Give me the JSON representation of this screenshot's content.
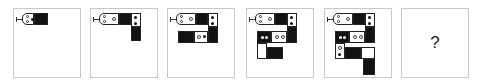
{
  "puzzle": {
    "description": "Sequence of snake-like block figures; predict the next figure",
    "panels": [
      {
        "index": 1,
        "content": "figure",
        "segments": [
          "head",
          "ring-dot cell",
          "black"
        ]
      },
      {
        "index": 2,
        "content": "figure",
        "segments": [
          "head",
          "ring cell",
          "black",
          "two-dot cell",
          "black"
        ]
      },
      {
        "index": 3,
        "content": "figure",
        "segments": [
          "head",
          "ring cell",
          "black",
          "two-dot cell",
          "black",
          "ring-dot cell",
          "black"
        ]
      },
      {
        "index": 4,
        "content": "figure",
        "segments": [
          "head",
          "ring cell",
          "black",
          "two-dot cell",
          "black",
          "two-ring cell",
          "black two-dot cell",
          "white",
          "black"
        ]
      },
      {
        "index": 5,
        "content": "figure",
        "segments": [
          "head",
          "ring cell",
          "black",
          "two-dot cell",
          "black",
          "two-ring cell",
          "black two-dot cell",
          "ring-dot cell",
          "black",
          "white",
          "black"
        ]
      },
      {
        "index": 6,
        "content": "question",
        "label": "?"
      }
    ]
  },
  "colors": {
    "border": "#c8c8c8",
    "fill": "#111111",
    "background": "#ffffff"
  }
}
